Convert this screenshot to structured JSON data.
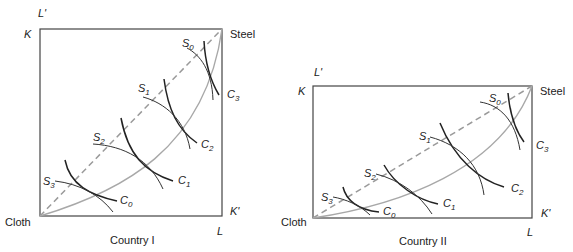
{
  "panels": [
    {
      "id": "country-1",
      "caption": "Country I",
      "corners": {
        "top_left_outer": "L'",
        "top_left": "K",
        "top_right": "Steel",
        "bottom_right_side": "K'",
        "bottom_right": "L",
        "bottom_left": "Cloth"
      },
      "cloth_isoquants": [
        "C",
        "C",
        "C",
        "C"
      ],
      "cloth_subscripts": [
        "0",
        "1",
        "2",
        "3"
      ],
      "steel_isoquants": [
        "S",
        "S",
        "S",
        "S"
      ],
      "steel_subscripts": [
        "0",
        "1",
        "2",
        "3"
      ]
    },
    {
      "id": "country-2",
      "caption": "Country II",
      "corners": {
        "top_left_outer": "L'",
        "top_left": "K",
        "top_right": "Steel",
        "bottom_right_side": "K'",
        "bottom_right": "L",
        "bottom_left": "Cloth"
      },
      "cloth_isoquants": [
        "C",
        "C",
        "C",
        "C"
      ],
      "cloth_subscripts": [
        "0",
        "1",
        "2",
        "3"
      ],
      "steel_isoquants": [
        "S",
        "S",
        "S",
        "S"
      ],
      "steel_subscripts": [
        "0",
        "1",
        "2",
        "3"
      ]
    }
  ],
  "colors": {
    "box": "#444444",
    "diagonal": "#9a9a9a",
    "contract_curve": "#a8a8a8",
    "isoquant": "#222222"
  }
}
